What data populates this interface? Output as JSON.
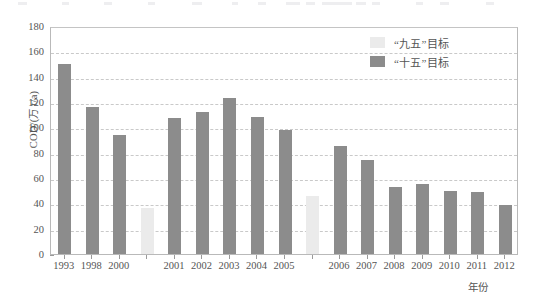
{
  "chart_data": {
    "type": "bar",
    "title": "",
    "subtitle": "",
    "xlabel": "年份",
    "ylabel": "COD/(万 t/a)",
    "ylim": [
      0,
      180
    ],
    "ytick_step": 20,
    "yticks": [
      0,
      20,
      40,
      60,
      80,
      100,
      120,
      140,
      160,
      180
    ],
    "grid": true,
    "grid_style": "dashed-horizontal",
    "legend_position": "top-right",
    "legend": [
      {
        "label": "“九五”目标",
        "color": "#ebebeb",
        "series": "ninth-five-year-target"
      },
      {
        "label": "“十五”目标",
        "color": "#8c8c8c",
        "series": "tenth-five-year-target"
      }
    ],
    "categories": [
      "1993",
      "1998",
      "2000",
      "",
      "2001",
      "2002",
      "2003",
      "2004",
      "2005",
      "",
      "2006",
      "2007",
      "2008",
      "2009",
      "2010",
      "2011",
      "2012"
    ],
    "values": [
      150,
      116,
      94,
      36,
      107,
      112,
      123,
      108,
      98,
      46,
      85,
      74,
      53,
      55,
      50,
      49,
      39
    ],
    "bars": [
      {
        "label": "1993",
        "value": 150,
        "series": "tenth-five-year-target",
        "color": "#8c8c8c"
      },
      {
        "label": "1998",
        "value": 116,
        "series": "tenth-five-year-target",
        "color": "#8c8c8c"
      },
      {
        "label": "2000",
        "value": 94,
        "series": "tenth-five-year-target",
        "color": "#8c8c8c"
      },
      {
        "label": "",
        "value": 36,
        "series": "ninth-five-year-target",
        "color": "#ebebeb"
      },
      {
        "label": "2001",
        "value": 107,
        "series": "tenth-five-year-target",
        "color": "#8c8c8c"
      },
      {
        "label": "2002",
        "value": 112,
        "series": "tenth-five-year-target",
        "color": "#8c8c8c"
      },
      {
        "label": "2003",
        "value": 123,
        "series": "tenth-five-year-target",
        "color": "#8c8c8c"
      },
      {
        "label": "2004",
        "value": 108,
        "series": "tenth-five-year-target",
        "color": "#8c8c8c"
      },
      {
        "label": "2005",
        "value": 98,
        "series": "tenth-five-year-target",
        "color": "#8c8c8c"
      },
      {
        "label": "",
        "value": 46,
        "series": "ninth-five-year-target",
        "color": "#ebebeb"
      },
      {
        "label": "2006",
        "value": 85,
        "series": "tenth-five-year-target",
        "color": "#8c8c8c"
      },
      {
        "label": "2007",
        "value": 74,
        "series": "tenth-five-year-target",
        "color": "#8c8c8c"
      },
      {
        "label": "2008",
        "value": 53,
        "series": "tenth-five-year-target",
        "color": "#8c8c8c"
      },
      {
        "label": "2009",
        "value": 55,
        "series": "tenth-five-year-target",
        "color": "#8c8c8c"
      },
      {
        "label": "2010",
        "value": 50,
        "series": "tenth-five-year-target",
        "color": "#8c8c8c"
      },
      {
        "label": "2011",
        "value": 49,
        "series": "tenth-five-year-target",
        "color": "#8c8c8c"
      },
      {
        "label": "2012",
        "value": 39,
        "series": "tenth-five-year-target",
        "color": "#8c8c8c"
      }
    ]
  },
  "colors": {
    "bar_dark": "#8c8c8c",
    "bar_light": "#ebebeb",
    "grid": "#c9c9c9",
    "axis": "#b9b9b9",
    "text": "#555555"
  }
}
